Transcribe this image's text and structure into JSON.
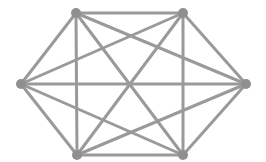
{
  "diagram": {
    "type": "complete-graph",
    "name": "K6",
    "edge_color": "#9a9a9a",
    "node_color": "#8f8f8f",
    "edge_width": 3,
    "node_radius": 5,
    "nodes": [
      {
        "id": "top-left",
        "x": 76,
        "y": 13
      },
      {
        "id": "top-right",
        "x": 183,
        "y": 13
      },
      {
        "id": "right",
        "x": 246,
        "y": 84
      },
      {
        "id": "bottom-right",
        "x": 183,
        "y": 155
      },
      {
        "id": "bottom-left",
        "x": 77,
        "y": 155
      },
      {
        "id": "left",
        "x": 21,
        "y": 84
      }
    ],
    "edges": "all-pairs"
  }
}
